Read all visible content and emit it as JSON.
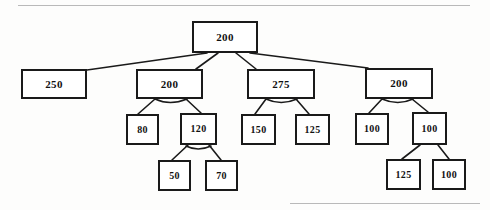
{
  "diagram": {
    "kind": "tree-diagram",
    "background_color": "#fdfdfc",
    "node_border_color": "#1a1a1a",
    "node_fill_color": "#ffffff",
    "edge_color": "#1a1a1a",
    "scan_line_color": "#b9b9b9"
  },
  "chart_data": {
    "type": "tree",
    "title": "",
    "nodes": [
      {
        "id": "n-root",
        "label": "200",
        "level": 0,
        "x": 192,
        "y": 21,
        "w": 66,
        "h": 32,
        "font_size": 11
      },
      {
        "id": "n-250",
        "label": "250",
        "level": 1,
        "x": 21,
        "y": 69,
        "w": 66,
        "h": 30,
        "font_size": 11
      },
      {
        "id": "n-200a",
        "label": "200",
        "level": 1,
        "x": 136,
        "y": 69,
        "w": 67,
        "h": 30,
        "font_size": 11
      },
      {
        "id": "n-275",
        "label": "275",
        "level": 1,
        "x": 247,
        "y": 69,
        "w": 68,
        "h": 30,
        "font_size": 11
      },
      {
        "id": "n-200b",
        "label": "200",
        "level": 1,
        "x": 365,
        "y": 68,
        "w": 68,
        "h": 31,
        "font_size": 11
      },
      {
        "id": "n-80",
        "label": "80",
        "level": 2,
        "x": 126,
        "y": 114,
        "w": 33,
        "h": 31,
        "font_size": 10
      },
      {
        "id": "n-120",
        "label": "120",
        "level": 2,
        "x": 180,
        "y": 113,
        "w": 37,
        "h": 32,
        "font_size": 10
      },
      {
        "id": "n-150",
        "label": "150",
        "level": 2,
        "x": 241,
        "y": 114,
        "w": 35,
        "h": 31,
        "font_size": 10
      },
      {
        "id": "n-125a",
        "label": "125",
        "level": 2,
        "x": 295,
        "y": 114,
        "w": 35,
        "h": 31,
        "font_size": 10
      },
      {
        "id": "n-100a",
        "label": "100",
        "level": 2,
        "x": 355,
        "y": 113,
        "w": 34,
        "h": 32,
        "font_size": 10
      },
      {
        "id": "n-100b",
        "label": "100",
        "level": 2,
        "x": 412,
        "y": 112,
        "w": 35,
        "h": 33,
        "font_size": 10
      },
      {
        "id": "n-50",
        "label": "50",
        "level": 3,
        "x": 158,
        "y": 160,
        "w": 33,
        "h": 31,
        "font_size": 10
      },
      {
        "id": "n-70",
        "label": "70",
        "level": 3,
        "x": 205,
        "y": 160,
        "w": 33,
        "h": 31,
        "font_size": 10
      },
      {
        "id": "n-125b",
        "label": "125",
        "level": 3,
        "x": 386,
        "y": 159,
        "w": 35,
        "h": 31,
        "font_size": 10
      },
      {
        "id": "n-100c",
        "label": "100",
        "level": 3,
        "x": 432,
        "y": 159,
        "w": 34,
        "h": 31,
        "font_size": 10
      }
    ],
    "edges": [
      {
        "from": "n-root",
        "to": "n-250",
        "x1": 207,
        "y1": 53,
        "x2": 87,
        "y2": 70
      },
      {
        "from": "n-root",
        "to": "n-200a",
        "x1": 218,
        "y1": 53,
        "x2": 196,
        "y2": 69
      },
      {
        "from": "n-root",
        "to": "n-275",
        "x1": 236,
        "y1": 53,
        "x2": 256,
        "y2": 69
      },
      {
        "from": "n-root",
        "to": "n-200b",
        "x1": 250,
        "y1": 53,
        "x2": 368,
        "y2": 68
      },
      {
        "from": "n-200a",
        "to": "n-80",
        "x1": 155,
        "y1": 99,
        "x2": 138,
        "y2": 114
      },
      {
        "from": "n-200a",
        "to": "n-120",
        "x1": 186,
        "y1": 99,
        "x2": 201,
        "y2": 113
      },
      {
        "from": "n-275",
        "to": "n-150",
        "x1": 266,
        "y1": 99,
        "x2": 255,
        "y2": 114
      },
      {
        "from": "n-275",
        "to": "n-125a",
        "x1": 296,
        "y1": 99,
        "x2": 309,
        "y2": 114
      },
      {
        "from": "n-200b",
        "to": "n-100a",
        "x1": 382,
        "y1": 99,
        "x2": 369,
        "y2": 113
      },
      {
        "from": "n-200b",
        "to": "n-100b",
        "x1": 412,
        "y1": 99,
        "x2": 428,
        "y2": 112
      },
      {
        "from": "n-120",
        "to": "n-50",
        "x1": 188,
        "y1": 145,
        "x2": 172,
        "y2": 160
      },
      {
        "from": "n-120",
        "to": "n-70",
        "x1": 209,
        "y1": 145,
        "x2": 221,
        "y2": 160
      },
      {
        "from": "n-100b",
        "to": "n-125b",
        "x1": 420,
        "y1": 145,
        "x2": 402,
        "y2": 159
      },
      {
        "from": "n-100b",
        "to": "n-100c",
        "x1": 438,
        "y1": 145,
        "x2": 449,
        "y2": 159
      }
    ],
    "arcs": [
      {
        "under": "n-200a",
        "x1": 155,
        "y1": 99,
        "cx": 170,
        "cy": 106,
        "x2": 187,
        "y2": 99
      },
      {
        "under": "n-275",
        "x1": 266,
        "y1": 99,
        "cx": 281,
        "cy": 106,
        "x2": 297,
        "y2": 99
      },
      {
        "under": "n-200b",
        "x1": 382,
        "y1": 99,
        "cx": 398,
        "cy": 106,
        "x2": 413,
        "y2": 99
      },
      {
        "under": "n-120",
        "x1": 186,
        "y1": 146,
        "cx": 198,
        "cy": 152,
        "x2": 211,
        "y2": 146
      }
    ],
    "scan_lines": [
      {
        "x": 18,
        "y": 5,
        "width": 452
      },
      {
        "x": 290,
        "y": 203,
        "width": 190
      }
    ]
  }
}
